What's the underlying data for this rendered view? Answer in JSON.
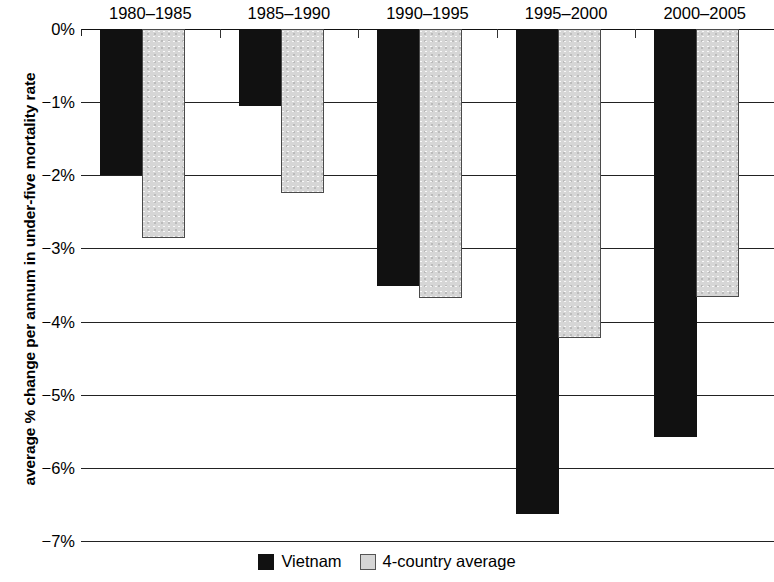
{
  "chart_data": {
    "type": "bar",
    "title": "",
    "subtitle": "",
    "xlabel": "",
    "ylabel": "average % change per annum in under-five mortality rate",
    "categories": [
      "1980–1985",
      "1985–1990",
      "1990–1995",
      "1995–2000",
      "2000–2005"
    ],
    "series": [
      {
        "name": "Vietnam",
        "color": "#111111",
        "values": [
          -1.97,
          -1.03,
          -3.48,
          -6.61,
          -5.55
        ]
      },
      {
        "name": "4-country average",
        "color": "#d6d6d6",
        "values": [
          -2.83,
          -2.21,
          -3.65,
          -4.2,
          -3.63
        ]
      }
    ],
    "ylim": [
      -7,
      0
    ],
    "yticks": [
      0,
      -1,
      -2,
      -3,
      -4,
      -5,
      -6,
      -7
    ],
    "ytick_labels": [
      "0%",
      "−1%",
      "−2%",
      "−3%",
      "−4%",
      "−5%",
      "−6%",
      "−7%"
    ],
    "grid": true,
    "legend_position": "bottom",
    "category_labels_position": "top",
    "bar_orientation": "downward"
  },
  "legend": {
    "items": [
      {
        "label": "Vietnam",
        "swatch": "black-square-swatch"
      },
      {
        "label": "4-country average",
        "swatch": "gray-square-swatch"
      }
    ]
  }
}
